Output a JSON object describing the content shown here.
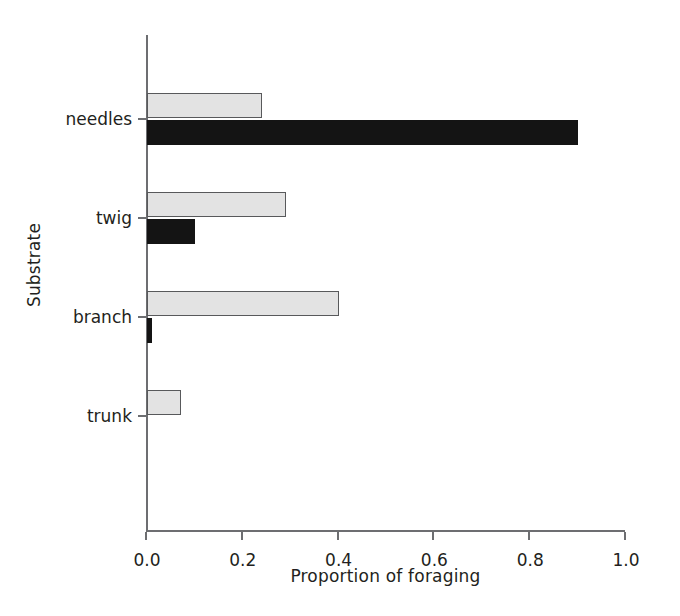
{
  "chart_data": {
    "type": "bar",
    "orientation": "horizontal",
    "title": "",
    "subtitle": "",
    "xlabel": "Proportion of foraging",
    "ylabel": "Substrate",
    "categories": [
      "needles",
      "twig",
      "branch",
      "trunk"
    ],
    "series": [
      {
        "name": "light-series",
        "color": "#e3e3e3",
        "values": [
          0.24,
          0.29,
          0.4,
          0.07
        ]
      },
      {
        "name": "dark-series",
        "color": "#141414",
        "values": [
          0.9,
          0.1,
          0.01,
          0.0
        ]
      }
    ],
    "xlim": [
      0.0,
      1.0
    ],
    "xticks": [
      "0.0",
      "0.2",
      "0.4",
      "0.6",
      "0.8",
      "1.0"
    ],
    "xtick_values": [
      0.0,
      0.2,
      0.4,
      0.6,
      0.8,
      1.0
    ],
    "grid": false,
    "legend": false,
    "legend_position": "none",
    "background_color": "#ffffff",
    "axis_color": "#6d6e71",
    "text_color": "#231f20"
  }
}
